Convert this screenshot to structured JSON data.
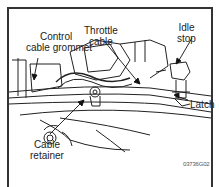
{
  "figure": {
    "labels": {
      "control_cable_grommet": [
        "Control",
        "cable grommet"
      ],
      "throttle_cable": [
        "Throttle",
        "cable"
      ],
      "idle_stop": [
        "Idle",
        "stop"
      ],
      "latch": "Latch",
      "cable_retainer": [
        "Cable",
        "retainer"
      ]
    },
    "figure_code": "03736G02"
  }
}
